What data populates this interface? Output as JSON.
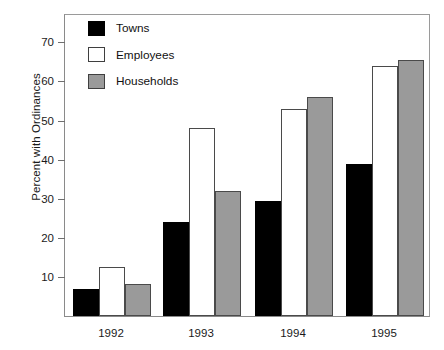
{
  "chart_data": {
    "type": "bar",
    "title": "",
    "xlabel": "",
    "ylabel": "Percent with Ordinances",
    "categories": [
      "1992",
      "1993",
      "1994",
      "1995"
    ],
    "series": [
      {
        "name": "Towns",
        "color": "#000000",
        "values": [
          7,
          24,
          29.5,
          39
        ]
      },
      {
        "name": "Employees",
        "color": "#ffffff",
        "values": [
          12.5,
          48,
          53,
          64
        ]
      },
      {
        "name": "Households",
        "color": "#9a9a9a",
        "values": [
          8.3,
          32,
          56,
          65.5
        ]
      }
    ],
    "ylim": [
      0,
      77
    ],
    "yticks": [
      10,
      20,
      30,
      40,
      50,
      60,
      70
    ],
    "ytick_labels": [
      "10",
      "20",
      "30",
      "40",
      "50",
      "60",
      "70"
    ],
    "grid": false,
    "legend_position": "top-left"
  }
}
